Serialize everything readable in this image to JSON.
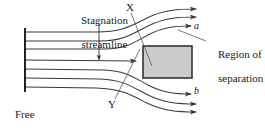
{
  "figure": {
    "background_color": "#ffffff",
    "stroke_color": "#333333",
    "body_fill_color": "#cccccc",
    "body_border_color": "#333333",
    "width": 265,
    "height": 128
  },
  "labels": {
    "stagnation_streamline": "Stagnation\nstreamline",
    "stagnation_line1": "Stagnation",
    "stagnation_line2": "streamline",
    "point_x": "X",
    "point_y": "Y",
    "streamline_a": "a",
    "streamline_b": "b",
    "region_of_separation": "Region of\nseparation",
    "region_line1": "Region of",
    "region_line2": "separation",
    "free_stream": "Free\nstream",
    "free_line1": "Free",
    "free_line2": "stream"
  },
  "diagram": {
    "body": {
      "x": 143,
      "y": 46,
      "width": 49,
      "height": 32
    },
    "inlet_rake": {
      "x": 25,
      "y_top": 28,
      "y_bottom": 92
    },
    "streamline_inlet_y": [
      32,
      41,
      49,
      60,
      69,
      78,
      87
    ],
    "streamline_count": 7,
    "arrowhead_count": 7,
    "leader_lines": [
      {
        "name": "stagnation-arrow",
        "from": [
          99,
          22
        ],
        "to": [
          99,
          62
        ]
      },
      {
        "name": "x-leader",
        "from": [
          130,
          12
        ],
        "to": [
          152,
          64
        ]
      },
      {
        "name": "y-leader",
        "from": [
          114,
          99
        ],
        "to": [
          139,
          50
        ]
      },
      {
        "name": "region-leader",
        "from": [
          205,
          41
        ],
        "to": [
          178,
          30
        ]
      }
    ]
  }
}
